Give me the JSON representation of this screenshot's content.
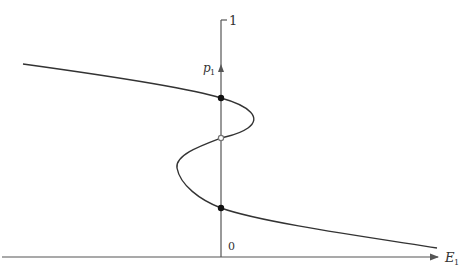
{
  "diagram": {
    "title": "",
    "y_axis": {
      "label": "p",
      "label_sub": "1",
      "top_tick_label": "1",
      "origin_label": "0"
    },
    "x_axis": {
      "label": "E",
      "label_sub": "1"
    },
    "curve": {
      "description": "S-shaped curve of p1 versus E1 with three intersections of the vertical axis"
    },
    "points": [
      {
        "name": "upper-stable",
        "style": "filled",
        "color": "#111111"
      },
      {
        "name": "middle-unstable",
        "style": "open",
        "color": "#777777"
      },
      {
        "name": "lower-stable",
        "style": "filled",
        "color": "#111111"
      }
    ],
    "colors": {
      "axis": "#555555",
      "curve": "#333333"
    }
  }
}
